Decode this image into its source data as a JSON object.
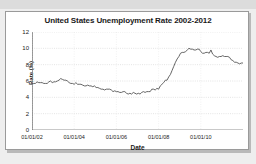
{
  "card": {
    "background_color": "#ffffff",
    "border_color": "#9a9a9a"
  },
  "page": {
    "background_color": "#eeeeee"
  },
  "chart_data": {
    "type": "line",
    "title": "United States Unemployment Rate 2002-2012",
    "xlabel": "Date",
    "ylabel": "Rate (%)",
    "grid": true,
    "legend": "none",
    "line_color": "#555555",
    "ylim": [
      0,
      12
    ],
    "yticks": [
      0,
      2,
      4,
      6,
      8,
      10,
      12
    ],
    "ytick_labels": [
      "0",
      "2",
      "4",
      "6",
      "8",
      "10",
      "12"
    ],
    "xlim": [
      "01/01/02",
      "01/01/12"
    ],
    "xticks": [
      "01/01/02",
      "01/01/04",
      "01/01/06",
      "01/01/08",
      "01/01/10"
    ],
    "xtick_positions": [
      0.0,
      0.2,
      0.4,
      0.6,
      0.8
    ],
    "x": [
      "2002-01",
      "2002-02",
      "2002-03",
      "2002-04",
      "2002-05",
      "2002-06",
      "2002-07",
      "2002-08",
      "2002-09",
      "2002-10",
      "2002-11",
      "2002-12",
      "2003-01",
      "2003-02",
      "2003-03",
      "2003-04",
      "2003-05",
      "2003-06",
      "2003-07",
      "2003-08",
      "2003-09",
      "2003-10",
      "2003-11",
      "2003-12",
      "2004-01",
      "2004-02",
      "2004-03",
      "2004-04",
      "2004-05",
      "2004-06",
      "2004-07",
      "2004-08",
      "2004-09",
      "2004-10",
      "2004-11",
      "2004-12",
      "2005-01",
      "2005-02",
      "2005-03",
      "2005-04",
      "2005-05",
      "2005-06",
      "2005-07",
      "2005-08",
      "2005-09",
      "2005-10",
      "2005-11",
      "2005-12",
      "2006-01",
      "2006-02",
      "2006-03",
      "2006-04",
      "2006-05",
      "2006-06",
      "2006-07",
      "2006-08",
      "2006-09",
      "2006-10",
      "2006-11",
      "2006-12",
      "2007-01",
      "2007-02",
      "2007-03",
      "2007-04",
      "2007-05",
      "2007-06",
      "2007-07",
      "2007-08",
      "2007-09",
      "2007-10",
      "2007-11",
      "2007-12",
      "2008-01",
      "2008-02",
      "2008-03",
      "2008-04",
      "2008-05",
      "2008-06",
      "2008-07",
      "2008-08",
      "2008-09",
      "2008-10",
      "2008-11",
      "2008-12",
      "2009-01",
      "2009-02",
      "2009-03",
      "2009-04",
      "2009-05",
      "2009-06",
      "2009-07",
      "2009-08",
      "2009-09",
      "2009-10",
      "2009-11",
      "2009-12",
      "2010-01",
      "2010-02",
      "2010-03",
      "2010-04",
      "2010-05",
      "2010-06",
      "2010-07",
      "2010-08",
      "2010-09",
      "2010-10",
      "2010-11",
      "2010-12",
      "2011-01",
      "2011-02",
      "2011-03",
      "2011-04",
      "2011-05",
      "2011-06",
      "2011-07",
      "2011-08",
      "2011-09",
      "2011-10",
      "2011-11",
      "2011-12",
      "2012-01",
      "2012-02",
      "2012-03",
      "2012-04",
      "2012-05",
      "2012-06"
    ],
    "values": [
      5.7,
      5.7,
      5.7,
      5.9,
      5.8,
      5.8,
      5.8,
      5.7,
      5.7,
      5.7,
      5.9,
      6.0,
      5.8,
      5.9,
      5.9,
      6.0,
      6.1,
      6.3,
      6.2,
      6.1,
      6.1,
      6.0,
      5.8,
      5.7,
      5.7,
      5.6,
      5.8,
      5.6,
      5.6,
      5.6,
      5.5,
      5.4,
      5.4,
      5.5,
      5.4,
      5.4,
      5.3,
      5.4,
      5.2,
      5.2,
      5.1,
      5.0,
      5.0,
      4.9,
      5.0,
      5.0,
      5.0,
      4.9,
      4.7,
      4.8,
      4.7,
      4.7,
      4.6,
      4.6,
      4.7,
      4.7,
      4.5,
      4.4,
      4.5,
      4.4,
      4.6,
      4.5,
      4.4,
      4.5,
      4.4,
      4.6,
      4.7,
      4.6,
      4.7,
      4.7,
      4.7,
      5.0,
      5.0,
      4.9,
      5.1,
      5.0,
      5.4,
      5.6,
      5.8,
      6.1,
      6.1,
      6.5,
      6.8,
      7.3,
      7.8,
      8.3,
      8.7,
      9.0,
      9.4,
      9.5,
      9.5,
      9.6,
      9.8,
      10.0,
      9.9,
      9.9,
      9.8,
      9.8,
      9.9,
      9.9,
      9.6,
      9.4,
      9.4,
      9.5,
      9.5,
      9.4,
      9.8,
      9.3,
      9.1,
      9.0,
      8.9,
      9.0,
      9.0,
      9.1,
      9.0,
      9.0,
      9.0,
      8.9,
      8.6,
      8.5,
      8.3,
      8.3,
      8.2,
      8.1,
      8.2,
      8.2
    ]
  }
}
